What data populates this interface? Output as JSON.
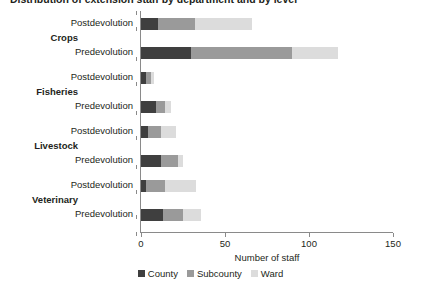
{
  "chart_data": {
    "type": "bar",
    "orientation": "horizontal",
    "stacked": true,
    "title": "Distribution of extension staff by department and by level",
    "xlabel": "Number of staff",
    "ylabel": "",
    "xlim": [
      0,
      150
    ],
    "xticks": [
      0,
      50,
      100,
      150
    ],
    "grid": false,
    "legend_position": "bottom",
    "groups": [
      "Crops",
      "Fisheries",
      "Livestock",
      "Veterinary"
    ],
    "categories": [
      "Postdevolution",
      "Predevolution",
      "Postdevolution",
      "Predevolution",
      "Postdevolution",
      "Predevolution",
      "Postdevolution",
      "Predevolution"
    ],
    "series": [
      {
        "name": "County",
        "color": "#3f3f3f",
        "values": [
          10,
          30,
          3,
          9,
          4,
          12,
          3,
          13
        ]
      },
      {
        "name": "Subcounty",
        "color": "#9a9a9a",
        "values": [
          22,
          60,
          3,
          5,
          8,
          10,
          11,
          12
        ]
      },
      {
        "name": "Ward",
        "color": "#dcdcdc",
        "values": [
          34,
          27,
          2,
          4,
          9,
          3,
          19,
          11
        ]
      }
    ],
    "totals": [
      66,
      117,
      8,
      18,
      21,
      25,
      33,
      36
    ]
  },
  "axis": {
    "x_tick_labels": [
      "0",
      "50",
      "100",
      "150"
    ],
    "x_title": "Number of staff"
  },
  "legend": {
    "items": [
      {
        "label": "County",
        "color": "#3f3f3f"
      },
      {
        "label": "Subcounty",
        "color": "#9a9a9a"
      },
      {
        "label": "Ward",
        "color": "#dcdcdc"
      }
    ]
  },
  "group_labels": [
    "Crops",
    "Fisheries",
    "Livestock",
    "Veterinary"
  ],
  "row_labels": [
    "Postdevolution",
    "Predevolution",
    "Postdevolution",
    "Predevolution",
    "Postdevolution",
    "Predevolution",
    "Postdevolution",
    "Predevolution"
  ],
  "title": "Distribution of extension staff by department and by level"
}
